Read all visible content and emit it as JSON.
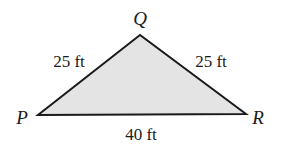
{
  "figure": {
    "type": "triangle",
    "fill_color": "#e4e4e4",
    "stroke_color": "#1a1a1a",
    "vertices": [
      {
        "name": "Q",
        "x": 140,
        "y": 35,
        "label_x": 140,
        "label_y": 25
      },
      {
        "name": "P",
        "x": 38,
        "y": 115,
        "label_x": 22,
        "label_y": 124
      },
      {
        "name": "R",
        "x": 246,
        "y": 114,
        "label_x": 258,
        "label_y": 124
      }
    ],
    "sides": [
      {
        "between": "PQ",
        "length": "25 ft",
        "label_x": 69,
        "label_y": 67
      },
      {
        "between": "QR",
        "length": "25 ft",
        "label_x": 211,
        "label_y": 67
      },
      {
        "between": "PR",
        "length": "40 ft",
        "label_x": 141,
        "label_y": 140
      }
    ]
  }
}
